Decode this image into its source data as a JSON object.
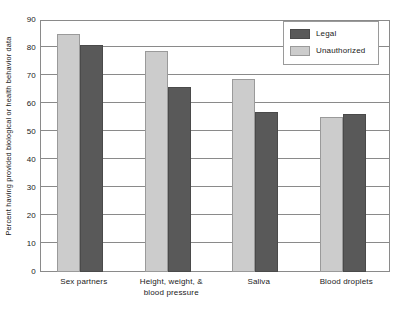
{
  "chart_data": {
    "type": "bar",
    "title": "",
    "xlabel": "",
    "ylabel": "Percent having provided biological or health behavior data",
    "ylim": [
      0,
      90
    ],
    "ytick_step": 10,
    "yticks": [
      0,
      10,
      20,
      30,
      40,
      50,
      60,
      70,
      80,
      90
    ],
    "ytick_labels": [
      "0",
      "10",
      "20",
      "30",
      "40",
      "50",
      "60",
      "70",
      "80",
      "90"
    ],
    "grid": true,
    "grid_axis": "y",
    "legend_position": "top-right",
    "categories": [
      "Sex partners",
      "Height, weight, & blood pressure",
      "Saliva",
      "Blood droplets"
    ],
    "category_lines": [
      [
        "Sex partners"
      ],
      [
        "Height, weight, &",
        "blood pressure"
      ],
      [
        "Saliva"
      ],
      [
        "Blood droplets"
      ]
    ],
    "series": [
      {
        "name": "Unauthorized",
        "color": "#cccccc",
        "values": [
          85,
          79,
          69,
          55.5
        ]
      },
      {
        "name": "Legal",
        "color": "#595959",
        "values": [
          81,
          66,
          57,
          56.5
        ]
      }
    ]
  },
  "legend": {
    "entries": [
      {
        "label": "Legal",
        "color": "#595959"
      },
      {
        "label": "Unauthorized",
        "color": "#cccccc"
      }
    ]
  },
  "colors": {
    "legal": "#595959",
    "unauthorized": "#cccccc",
    "axis": "#8a8a8a",
    "text": "#1a1a1a",
    "background": "#ffffff"
  }
}
